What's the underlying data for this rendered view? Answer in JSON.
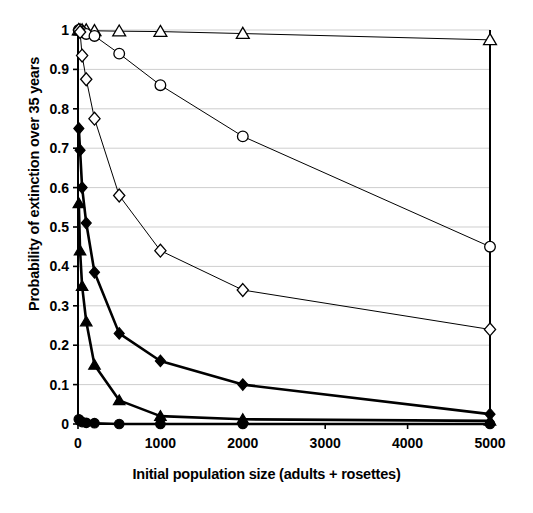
{
  "chart_data": {
    "type": "line",
    "title": "",
    "xlabel": "Initial population size (adults + rosettes)",
    "ylabel": "Probability of extinction over 35 years",
    "xlim": [
      0,
      5000
    ],
    "ylim": [
      0,
      1
    ],
    "xticks": [
      0,
      1000,
      2000,
      3000,
      4000,
      5000
    ],
    "xtick_labels": [
      "0",
      "1000",
      "2000",
      "3000",
      "4000",
      "5000"
    ],
    "yticks": [
      0,
      0.1,
      0.2,
      0.3,
      0.4,
      0.5,
      0.6,
      0.7,
      0.8,
      0.9,
      1
    ],
    "ytick_labels": [
      "0",
      "0.1",
      "0.2",
      "0.3",
      "0.4",
      "0.5",
      "0.6",
      "0.7",
      "0.8",
      "0.9",
      "1"
    ],
    "grid": true,
    "grid_axis": "y",
    "legend": null,
    "legend_position": "none",
    "series": [
      {
        "name": "open-triangle",
        "marker": "triangle-open",
        "filled": false,
        "line_width": 1,
        "x": [
          10,
          25,
          50,
          100,
          200,
          500,
          1000,
          2000,
          5000
        ],
        "y": [
          1.0,
          1.0,
          1.0,
          1.0,
          0.998,
          0.997,
          0.996,
          0.991,
          0.975
        ]
      },
      {
        "name": "open-circle",
        "marker": "circle-open",
        "filled": false,
        "line_width": 1,
        "x": [
          10,
          25,
          50,
          100,
          200,
          500,
          1000,
          2000,
          5000
        ],
        "y": [
          1.0,
          1.0,
          0.995,
          0.99,
          0.985,
          0.94,
          0.86,
          0.73,
          0.45
        ]
      },
      {
        "name": "open-diamond",
        "marker": "diamond-open",
        "filled": false,
        "line_width": 1,
        "x": [
          10,
          25,
          50,
          100,
          200,
          500,
          1000,
          2000,
          5000
        ],
        "y": [
          1.0,
          0.995,
          0.935,
          0.875,
          0.775,
          0.58,
          0.44,
          0.34,
          0.24
        ]
      },
      {
        "name": "filled-diamond",
        "marker": "diamond-filled",
        "filled": true,
        "line_width": 2.6,
        "x": [
          10,
          25,
          50,
          100,
          200,
          500,
          1000,
          2000,
          5000
        ],
        "y": [
          0.75,
          0.695,
          0.6,
          0.51,
          0.385,
          0.23,
          0.16,
          0.1,
          0.025
        ]
      },
      {
        "name": "filled-triangle",
        "marker": "triangle-filled",
        "filled": true,
        "line_width": 2.6,
        "x": [
          10,
          25,
          50,
          100,
          200,
          500,
          1000,
          2000,
          5000
        ],
        "y": [
          0.56,
          0.44,
          0.35,
          0.26,
          0.15,
          0.06,
          0.02,
          0.012,
          0.008
        ]
      },
      {
        "name": "filled-circle",
        "marker": "circle-filled",
        "filled": true,
        "line_width": 2.6,
        "x": [
          10,
          25,
          50,
          100,
          200,
          500,
          1000,
          2000,
          5000
        ],
        "y": [
          0.012,
          0.008,
          0.005,
          0.003,
          0.002,
          0.0,
          0.0,
          0.0,
          0.0
        ]
      }
    ]
  }
}
